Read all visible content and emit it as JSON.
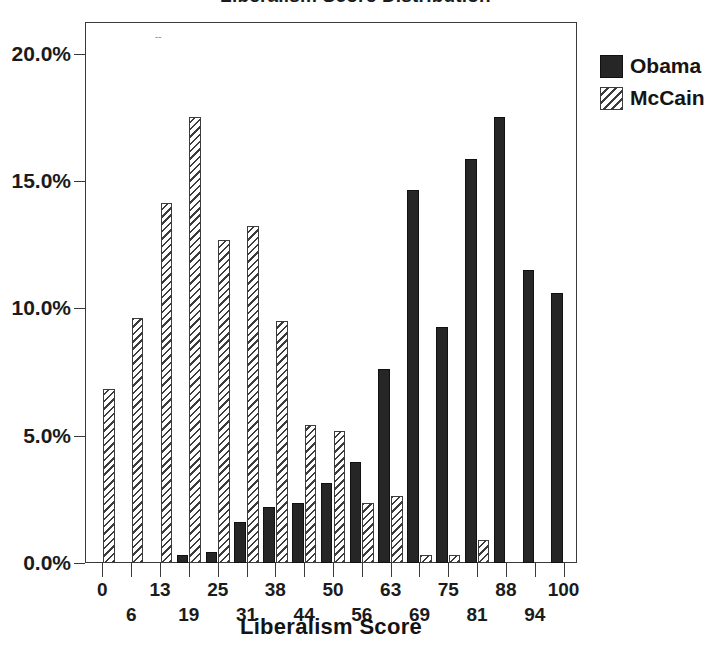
{
  "title": "Liberalism Score Distribution",
  "legend": {
    "position": "right",
    "items": [
      {
        "label": "Obama",
        "swatch": "solid-black-swatch",
        "color": "#262626"
      },
      {
        "label": "McCain",
        "swatch": "hatched-swatch",
        "color": "#3c3c3c"
      }
    ]
  },
  "axes": {
    "x": {
      "title": "Liberalism Score",
      "tick_labels": [
        "0",
        "6",
        "13",
        "19",
        "25",
        "31",
        "38",
        "44",
        "50",
        "56",
        "63",
        "69",
        "75",
        "81",
        "88",
        "94",
        "100"
      ]
    },
    "y": {
      "title": "",
      "tick_labels": [
        "0.0%",
        "5.0%",
        "10.0%",
        "15.0%",
        "20.0%"
      ],
      "tick_values": [
        0,
        5,
        10,
        15,
        20
      ],
      "min": 0,
      "max": 21.2
    }
  },
  "chart_data": {
    "type": "bar",
    "title": "Liberalism Score Distribution",
    "xlabel": "Liberalism Score",
    "ylabel": "",
    "ylim": [
      0,
      21.2
    ],
    "yticks": [
      0,
      5,
      10,
      15,
      20
    ],
    "ytick_labels": [
      "0.0%",
      "5.0%",
      "10.0%",
      "15.0%",
      "20.0%"
    ],
    "grid": false,
    "legend_position": "right",
    "units": "percent",
    "categories": [
      "0",
      "6",
      "13",
      "19",
      "25",
      "31",
      "38",
      "44",
      "50",
      "56",
      "63",
      "69",
      "75",
      "81",
      "88",
      "94",
      "100"
    ],
    "series": [
      {
        "name": "Obama",
        "color": "#262626",
        "values": [
          0.0,
          0.0,
          0.0,
          0.3,
          0.45,
          1.6,
          2.2,
          2.35,
          3.15,
          3.95,
          7.6,
          14.65,
          9.25,
          15.85,
          17.5,
          11.5,
          10.6
        ]
      },
      {
        "name": "McCain",
        "color": "#3c3c3c",
        "values": [
          6.85,
          9.6,
          14.15,
          17.5,
          12.7,
          13.25,
          9.5,
          5.4,
          5.2,
          2.35,
          2.65,
          0.3,
          0.3,
          0.9,
          0.0,
          0.0,
          0.0
        ]
      }
    ]
  }
}
